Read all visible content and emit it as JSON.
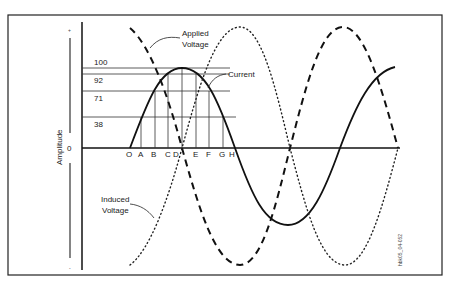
{
  "diagram": {
    "type": "ac-waveforms-inductive-circuit",
    "axis": {
      "ylabel": "Amplitude",
      "plus_symbol": "+",
      "minus_symbol": "-",
      "zero_label": "0"
    },
    "levels": [
      {
        "label": "100",
        "y": 68
      },
      {
        "label": "92",
        "y": 74
      },
      {
        "label": "71",
        "y": 91
      },
      {
        "label": "38",
        "y": 117
      }
    ],
    "points": [
      {
        "label": "O",
        "x": 130
      },
      {
        "label": "A",
        "x": 140
      },
      {
        "label": "B",
        "x": 154
      },
      {
        "label": "C",
        "x": 168
      },
      {
        "label": "D",
        "x": 179
      },
      {
        "label": "E",
        "x": 195
      },
      {
        "label": "F",
        "x": 209
      },
      {
        "label": "G",
        "x": 222
      },
      {
        "label": "H",
        "x": 233
      }
    ],
    "curves": {
      "applied_voltage": {
        "label_line1": "Applied",
        "label_line2": "Voltage",
        "style": "dashed"
      },
      "current": {
        "label": "Current",
        "style": "solid"
      },
      "induced_voltage": {
        "label_line1": "Induced",
        "label_line2": "Voltage",
        "style": "dotted"
      }
    },
    "figure_id": "hbk05_04-052"
  }
}
